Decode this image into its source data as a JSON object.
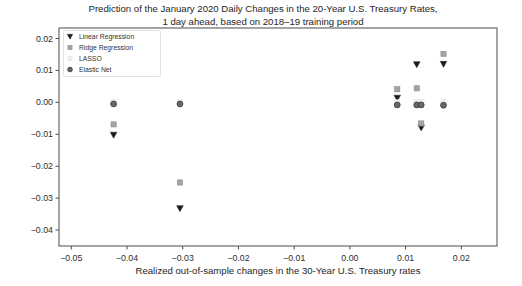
{
  "figure": {
    "title_line1": "Prediction of the January 2020 Daily Changes in the 20-Year U.S. Treasury Rates,",
    "title_line2": "1 day ahead, based on 2018–19 training period",
    "xlabel": "Realized out-of-sample changes in the 30-Year U.S. Treasury rates",
    "background": "#ffffff",
    "axis_color": "#4d4d4d",
    "text_color": "#262626"
  },
  "chart_data": {
    "type": "scatter",
    "title": "Prediction of the January 2020 Daily Changes in the 20-Year U.S. Treasury Rates, 1 day ahead, based on 2018–19 training period",
    "xlabel": "Realized out-of-sample changes in the 30-Year U.S. Treasury rates",
    "ylabel": "",
    "grid": false,
    "xlim": [
      -0.0522,
      0.0264
    ],
    "ylim": [
      -0.045,
      0.0233
    ],
    "x_ticks": [
      -0.05,
      -0.04,
      -0.03,
      -0.02,
      -0.01,
      0.0,
      0.01,
      0.02
    ],
    "x_tick_labels": [
      "−0.05",
      "−0.04",
      "−0.03",
      "−0.02",
      "−0.01",
      "0.00",
      "0.01",
      "0.02"
    ],
    "y_ticks": [
      0.02,
      0.01,
      0.0,
      -0.01,
      -0.02,
      -0.03,
      -0.04
    ],
    "y_tick_labels": [
      "0.02",
      "0.01",
      "0.00",
      "−0.01",
      "−0.02",
      "−0.03",
      "−0.04"
    ],
    "legend_position": "upper-left",
    "x": [
      -0.0424,
      -0.0305,
      0.0085,
      0.012,
      0.0128,
      0.0168
    ],
    "series": [
      {
        "name": "Linear Regression",
        "marker": "triangle-down",
        "color": "#1c1c1c",
        "edge": "#1c1c1c",
        "values": [
          -0.0102,
          -0.0332,
          0.0014,
          0.0119,
          -0.0079,
          0.012
        ]
      },
      {
        "name": "Ridge Regression",
        "marker": "square",
        "color": "#a3a3a3",
        "edge": "#8c8c8c",
        "values": [
          -0.0069,
          -0.0251,
          0.0041,
          0.0044,
          -0.0066,
          0.0152
        ]
      },
      {
        "name": "LASSO",
        "marker": "square",
        "color": "#f0f0f0",
        "edge": "#e2e2e2",
        "values": [
          0.0,
          0.0,
          0.0,
          0.0,
          0.0,
          0.0
        ]
      },
      {
        "name": "Elastic Net",
        "marker": "circle",
        "color": "#696969",
        "edge": "#3f3f3f",
        "values": [
          -0.0005,
          -0.0005,
          -0.0008,
          -0.0008,
          -0.0008,
          -0.0009
        ]
      }
    ]
  }
}
